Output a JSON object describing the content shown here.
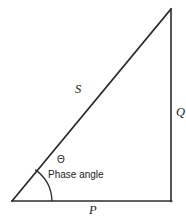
{
  "figure": {
    "type": "right-triangle-diagram",
    "background_color": "#ffffff",
    "line_color": "#2b2b2b",
    "text_color": "#1a1a1a",
    "labels": {
      "hypotenuse": "S",
      "vertical_side": "Q",
      "horizontal_side": "P",
      "angle_symbol": "Θ",
      "angle_caption": "Phase angle"
    },
    "geometry": {
      "vertex_origin": [
        12,
        201
      ],
      "vertex_right": [
        171,
        201
      ],
      "vertex_top": [
        171,
        9
      ],
      "arc_radius": 40,
      "arc_start": [
        52,
        201
      ],
      "arc_end": [
        35,
        170
      ]
    }
  }
}
